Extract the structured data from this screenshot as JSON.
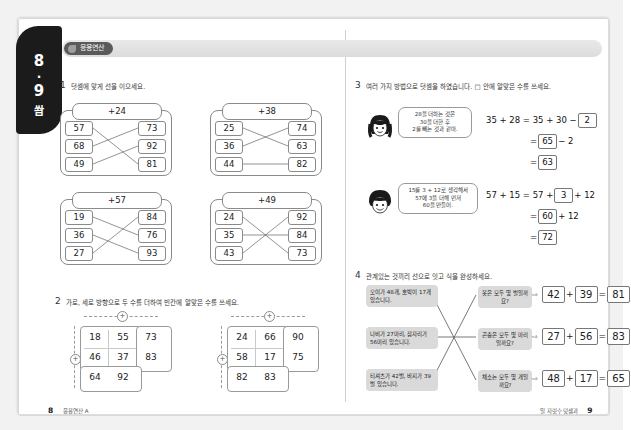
{
  "page_tab": {
    "left_page": "8",
    "dot": "·",
    "right_page": "9",
    "label": "쐄"
  },
  "header": {
    "badge": "응용연산"
  },
  "problem1": {
    "num": "1",
    "prompt": "덧셈에 맞게 선을 이으세요.",
    "boxes": [
      {
        "caption": "+24",
        "left": [
          "57",
          "68",
          "49"
        ],
        "right": [
          "73",
          "92",
          "81"
        ]
      },
      {
        "caption": "+38",
        "left": [
          "25",
          "36",
          "44"
        ],
        "right": [
          "74",
          "63",
          "82"
        ]
      },
      {
        "caption": "+57",
        "left": [
          "19",
          "36",
          "27"
        ],
        "right": [
          "84",
          "76",
          "93"
        ]
      },
      {
        "caption": "+49",
        "left": [
          "24",
          "35",
          "43"
        ],
        "right": [
          "92",
          "84",
          "73"
        ]
      }
    ]
  },
  "problem2": {
    "num": "2",
    "prompt": "가로, 세로 방향으로 두 수를 더하여 빈칸에 알맞은 수를 쓰세요.",
    "plus_sign": "+",
    "grids": [
      {
        "rows": [
          [
            "18",
            "55",
            "73"
          ],
          [
            "46",
            "37",
            "83"
          ],
          [
            "64",
            "92",
            ""
          ]
        ]
      },
      {
        "rows": [
          [
            "24",
            "66",
            "90"
          ],
          [
            "58",
            "17",
            "75"
          ],
          [
            "82",
            "83",
            ""
          ]
        ]
      }
    ]
  },
  "problem3": {
    "num": "3",
    "prompt": "여러 가지 방법으로 덧셈을 하였습니다. □ 안에 알맞은 수를 쓰세요.",
    "items": [
      {
        "speaker": "girl",
        "bubble": [
          "28을 더하는 것은",
          "30을 더한 후",
          "2를 빼는 것과 같아."
        ],
        "bubble_nums": [
          "28",
          "30",
          "2"
        ],
        "line1_prefix": "35 + 28 = 35 + 30 −",
        "line1_answer": "2",
        "line2_prefix": "=",
        "line2_answer": "65",
        "line2_suffix": "− 2",
        "line3_prefix": "=",
        "line3_answer": "63"
      },
      {
        "speaker": "boy",
        "bubble": [
          "15를 3 + 12로 생각해서",
          "57에 3을 더해 먼저",
          "60을 만들어."
        ],
        "bubble_nums": [
          "15",
          "3",
          "12",
          "57",
          "3",
          "60"
        ],
        "line1_prefix": "57 + 15 = 57 +",
        "line1_answer": "3",
        "line1_suffix": "+ 12",
        "line2_prefix": "=",
        "line2_answer": "60",
        "line2_suffix": "+ 12",
        "line3_prefix": "=",
        "line3_answer": "72"
      }
    ]
  },
  "problem4": {
    "num": "4",
    "prompt": "관계있는 것끼리 선으로 잇고 식을 완성하세요.",
    "statements": [
      "오이가 48개, 호박이 17개 있습니다.",
      "나비가 27마리, 잠자리가 56마리 있습니다.",
      "티셔츠가 42벌, 바지가 39벌 있습니다."
    ],
    "questions": [
      "옷은 모두 몇 벌일까요?",
      "곤충은 모두 몇 마리일까요?",
      "채소는 모두 몇 개일까요?"
    ],
    "arrow": "⇨",
    "equations": [
      {
        "a": "42",
        "plus": "+",
        "b": "39",
        "eq": "=",
        "result": "81"
      },
      {
        "a": "27",
        "plus": "+",
        "b": "56",
        "eq": "=",
        "result": "83"
      },
      {
        "a": "48",
        "plus": "+",
        "b": "17",
        "eq": "=",
        "result": "65"
      }
    ]
  },
  "footer": {
    "left_page": "8",
    "left_text": "응용연산 A",
    "right_text": "일 자릿수 덧셈과",
    "right_page": "9"
  }
}
